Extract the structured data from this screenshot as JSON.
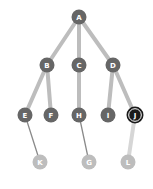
{
  "diagram": {
    "type": "tree",
    "nodes": [
      {
        "id": "A",
        "label": "A",
        "x": 79,
        "y": 17,
        "style": "normal"
      },
      {
        "id": "B",
        "label": "B",
        "x": 47,
        "y": 65,
        "style": "normal"
      },
      {
        "id": "C",
        "label": "C",
        "x": 79,
        "y": 65,
        "style": "normal"
      },
      {
        "id": "D",
        "label": "D",
        "x": 113,
        "y": 65,
        "style": "normal"
      },
      {
        "id": "E",
        "label": "E",
        "x": 25,
        "y": 115,
        "style": "normal"
      },
      {
        "id": "F",
        "label": "F",
        "x": 51,
        "y": 115,
        "style": "normal"
      },
      {
        "id": "H",
        "label": "H",
        "x": 79,
        "y": 115,
        "style": "normal"
      },
      {
        "id": "I",
        "label": "I",
        "x": 108,
        "y": 115,
        "style": "normal"
      },
      {
        "id": "J",
        "label": "J",
        "x": 135,
        "y": 115,
        "style": "selected"
      },
      {
        "id": "K",
        "label": "K",
        "x": 40,
        "y": 162,
        "style": "faded"
      },
      {
        "id": "G",
        "label": "G",
        "x": 89,
        "y": 162,
        "style": "faded"
      },
      {
        "id": "L",
        "label": "L",
        "x": 128,
        "y": 162,
        "style": "faded"
      }
    ],
    "edges": [
      {
        "from": "A",
        "to": "B",
        "style": "thick"
      },
      {
        "from": "A",
        "to": "C",
        "style": "thick"
      },
      {
        "from": "A",
        "to": "D",
        "style": "thick"
      },
      {
        "from": "B",
        "to": "E",
        "style": "thick"
      },
      {
        "from": "B",
        "to": "F",
        "style": "thick"
      },
      {
        "from": "C",
        "to": "H",
        "style": "thick"
      },
      {
        "from": "D",
        "to": "I",
        "style": "thick"
      },
      {
        "from": "D",
        "to": "J",
        "style": "thick"
      },
      {
        "from": "E",
        "to": "K",
        "style": "thin"
      },
      {
        "from": "H",
        "to": "G",
        "style": "thin"
      },
      {
        "from": "J",
        "to": "L",
        "style": "thick-faded"
      }
    ],
    "colors": {
      "node_normal": "#666666",
      "node_selected": "#1a1a1a",
      "node_selected_ring": "#ffffff",
      "node_faded": "#bdbdbd",
      "edge_thick": "#bdbdbd",
      "edge_thin": "#8a8a8a",
      "edge_thick_faded": "#d6d6d6",
      "label": "#ffffff"
    }
  }
}
